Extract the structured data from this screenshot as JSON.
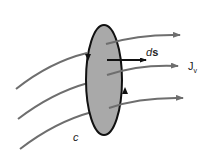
{
  "diagram": {
    "labels": {
      "ds": "ds",
      "ds_d": "d",
      "ds_s": "s",
      "J": "J",
      "J_sub": "v",
      "c": "c"
    },
    "colors": {
      "surface_fill": "#a9a9a9",
      "surface_stroke": "#111111",
      "flux_line": "#6e6e6e",
      "normal_vector": "#111111"
    }
  }
}
